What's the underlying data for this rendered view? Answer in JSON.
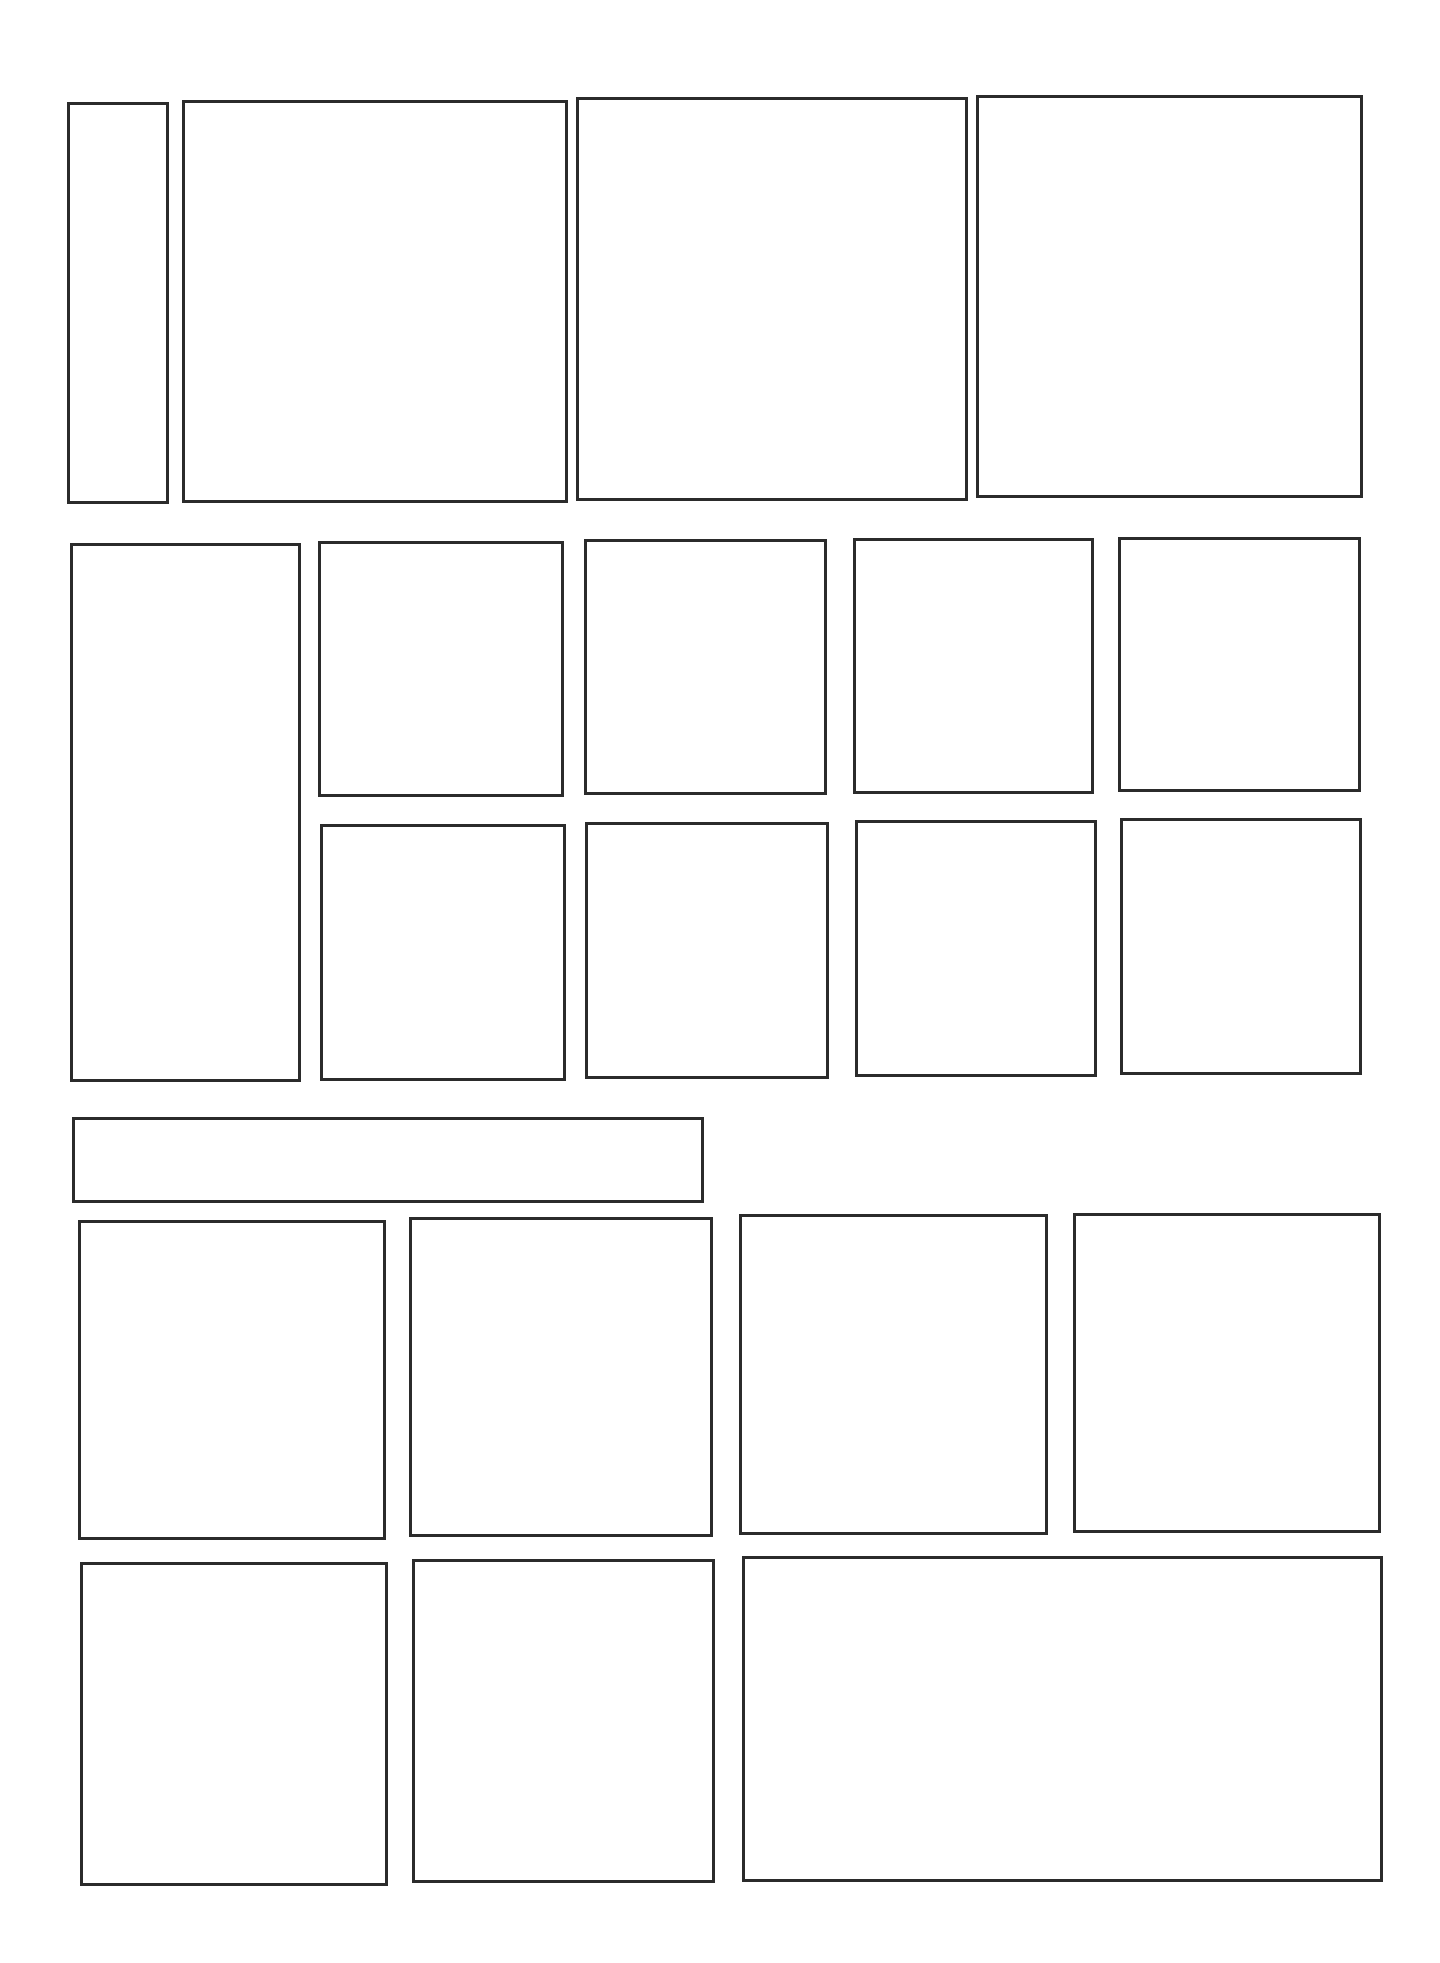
{
  "page": {
    "type": "blank comic page panel template",
    "background": "#ffffff",
    "border_color": "#2b2b2b",
    "panel_count": 22
  },
  "rows": [
    {
      "name": "row-1",
      "panels": [
        {
          "id": "r1-p1",
          "shape": "narrow-vertical",
          "x": 67,
          "y": 102,
          "w": 102,
          "h": 402
        },
        {
          "id": "r1-p2",
          "shape": "tall-rect",
          "x": 182,
          "y": 100,
          "w": 386,
          "h": 403
        },
        {
          "id": "r1-p3",
          "shape": "tall-rect",
          "x": 576,
          "y": 97,
          "w": 392,
          "h": 404
        },
        {
          "id": "r1-p4",
          "shape": "tall-rect",
          "x": 976,
          "y": 95,
          "w": 387,
          "h": 403
        }
      ]
    },
    {
      "name": "row-2",
      "panels": [
        {
          "id": "r2-p1",
          "shape": "tall-vertical",
          "x": 70,
          "y": 543,
          "w": 231,
          "h": 539
        },
        {
          "id": "r2-p2",
          "shape": "small-rect",
          "x": 318,
          "y": 541,
          "w": 246,
          "h": 256
        },
        {
          "id": "r2-p3",
          "shape": "small-rect",
          "x": 584,
          "y": 539,
          "w": 243,
          "h": 256
        },
        {
          "id": "r2-p4",
          "shape": "small-rect",
          "x": 853,
          "y": 538,
          "w": 241,
          "h": 256
        },
        {
          "id": "r2-p5",
          "shape": "small-rect",
          "x": 1118,
          "y": 537,
          "w": 243,
          "h": 255
        },
        {
          "id": "r2-p6",
          "shape": "small-rect",
          "x": 320,
          "y": 824,
          "w": 246,
          "h": 257
        },
        {
          "id": "r2-p7",
          "shape": "small-rect",
          "x": 585,
          "y": 822,
          "w": 244,
          "h": 257
        },
        {
          "id": "r2-p8",
          "shape": "small-rect",
          "x": 855,
          "y": 820,
          "w": 242,
          "h": 257
        },
        {
          "id": "r2-p9",
          "shape": "small-rect",
          "x": 1120,
          "y": 818,
          "w": 242,
          "h": 257
        }
      ]
    },
    {
      "name": "banner-row",
      "panels": [
        {
          "id": "banner",
          "shape": "wide-banner",
          "x": 72,
          "y": 1117,
          "w": 632,
          "h": 86
        }
      ]
    },
    {
      "name": "row-3",
      "panels": [
        {
          "id": "r3-p1",
          "shape": "tall-rect",
          "x": 78,
          "y": 1220,
          "w": 308,
          "h": 320
        },
        {
          "id": "r3-p2",
          "shape": "tall-rect",
          "x": 409,
          "y": 1217,
          "w": 304,
          "h": 320
        },
        {
          "id": "r3-p3",
          "shape": "tall-rect",
          "x": 739,
          "y": 1214,
          "w": 309,
          "h": 321
        },
        {
          "id": "r3-p4",
          "shape": "tall-rect",
          "x": 1073,
          "y": 1213,
          "w": 308,
          "h": 320
        }
      ]
    },
    {
      "name": "row-4",
      "panels": [
        {
          "id": "r4-p1",
          "shape": "tall-rect",
          "x": 80,
          "y": 1562,
          "w": 308,
          "h": 324
        },
        {
          "id": "r4-p2",
          "shape": "tall-rect",
          "x": 412,
          "y": 1559,
          "w": 303,
          "h": 324
        },
        {
          "id": "r4-p3",
          "shape": "wide-rect",
          "x": 742,
          "y": 1556,
          "w": 641,
          "h": 326
        }
      ]
    }
  ]
}
